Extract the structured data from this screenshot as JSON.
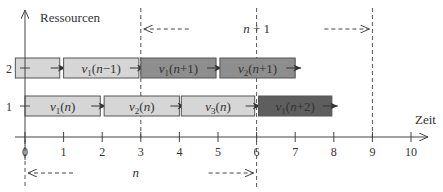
{
  "axes": {
    "y_label": "Ressourcen",
    "x_label": "Zeit",
    "y_ticks": [
      "1",
      "2"
    ],
    "x_ticks": [
      "0",
      "1",
      "2",
      "3",
      "4",
      "5",
      "6",
      "7",
      "8",
      "9",
      "10"
    ]
  },
  "periods": [
    {
      "label": "n",
      "start": 0,
      "end": 6
    },
    {
      "label": "n+1",
      "start": 3,
      "end": 9
    }
  ],
  "tasks": [
    {
      "resource": 2,
      "start": -0.25,
      "end": 0.9,
      "label": "",
      "shade": "light"
    },
    {
      "resource": 2,
      "start": 1.0,
      "end": 2.95,
      "label": "v1(n−1)",
      "shade": "light"
    },
    {
      "resource": 2,
      "start": 3.0,
      "end": 4.95,
      "label": "v1(n+1)",
      "shade": "mid"
    },
    {
      "resource": 2,
      "start": 5.05,
      "end": 7.0,
      "label": "v2(n+1)",
      "shade": "mid"
    },
    {
      "resource": 1,
      "start": 0.0,
      "end": 1.95,
      "label": "v1(n)",
      "shade": "light"
    },
    {
      "resource": 1,
      "start": 2.05,
      "end": 4.0,
      "label": "v2(n)",
      "shade": "light"
    },
    {
      "resource": 1,
      "start": 4.05,
      "end": 5.95,
      "label": "v3(n)",
      "shade": "light"
    },
    {
      "resource": 1,
      "start": 6.05,
      "end": 7.95,
      "label": "v1(n+2)",
      "shade": "dark"
    }
  ],
  "colors": {
    "light": "#d6d6d6",
    "mid": "#8e8e8e",
    "dark": "#5e5e5e",
    "stroke": "#555555",
    "axis": "#444444",
    "text_light": "#333333",
    "text_dark": "#eeeeee"
  }
}
